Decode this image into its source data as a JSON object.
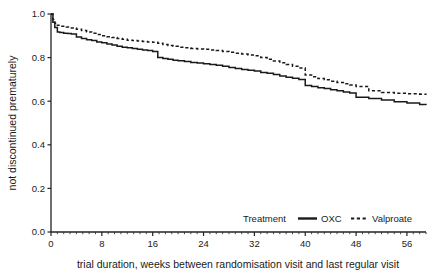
{
  "chart_data": {
    "type": "line",
    "title": "",
    "subtitle": "",
    "xlabel": "trial duration, weeks between randomisation visit and last regular visit",
    "ylabel": "not discontinued prematurely",
    "xlim": [
      0,
      59
    ],
    "ylim": [
      0.0,
      1.0
    ],
    "grid": false,
    "x_ticks": [
      0,
      8,
      16,
      24,
      32,
      40,
      48,
      56
    ],
    "x_tick_labels": [
      "0",
      "8",
      "16",
      "24",
      "32",
      "40",
      "48",
      "56"
    ],
    "y_ticks": [
      0.0,
      0.2,
      0.4,
      0.6,
      0.8,
      1.0
    ],
    "y_tick_labels": [
      "0.0",
      "0.2",
      "0.4",
      "0.6",
      "0.8",
      "1.0"
    ],
    "legend_position": "bottom-right",
    "legend_title": "Treatment",
    "series": [
      {
        "name": "OXC",
        "style": "solid",
        "color": "#1a1a1a",
        "x": [
          0,
          0.3,
          0.6,
          1.0,
          1.4,
          2.0,
          2.6,
          3.2,
          4.0,
          4.8,
          5.6,
          6.4,
          7.2,
          8.0,
          8.8,
          9.6,
          10.4,
          11.2,
          12.0,
          12.8,
          13.6,
          14.4,
          15.2,
          16.0,
          16.8,
          17.6,
          18.4,
          19.2,
          20.0,
          21.0,
          22.0,
          23.0,
          24.0,
          25.0,
          26.0,
          27.0,
          28.0,
          29.0,
          30.0,
          31.0,
          32.0,
          33.0,
          34.0,
          35.0,
          36.0,
          37.0,
          38.0,
          39.0,
          40.0,
          41.0,
          42.0,
          43.0,
          44.0,
          45.0,
          46.0,
          47.0,
          48.0,
          50.0,
          52.0,
          54.0,
          56.0,
          58.0,
          59.0
        ],
        "y": [
          1.0,
          0.962,
          0.938,
          0.918,
          0.915,
          0.912,
          0.91,
          0.908,
          0.895,
          0.888,
          0.882,
          0.878,
          0.872,
          0.868,
          0.862,
          0.858,
          0.852,
          0.848,
          0.845,
          0.842,
          0.838,
          0.835,
          0.832,
          0.828,
          0.8,
          0.796,
          0.792,
          0.788,
          0.785,
          0.782,
          0.778,
          0.775,
          0.772,
          0.768,
          0.765,
          0.76,
          0.755,
          0.75,
          0.745,
          0.742,
          0.738,
          0.732,
          0.728,
          0.722,
          0.716,
          0.71,
          0.705,
          0.7,
          0.672,
          0.668,
          0.662,
          0.658,
          0.652,
          0.648,
          0.642,
          0.638,
          0.618,
          0.612,
          0.605,
          0.598,
          0.592,
          0.585,
          0.582
        ]
      },
      {
        "name": "Valproate",
        "style": "dashed",
        "color": "#1a1a1a",
        "x": [
          0,
          0.3,
          0.6,
          1.0,
          1.6,
          2.4,
          3.2,
          4.0,
          4.8,
          5.6,
          6.4,
          7.2,
          8.0,
          8.8,
          9.6,
          10.4,
          11.2,
          12.0,
          12.8,
          13.6,
          14.4,
          15.2,
          16.0,
          16.8,
          17.6,
          18.4,
          19.2,
          20.0,
          21.0,
          22.0,
          23.0,
          24.0,
          25.0,
          26.0,
          27.0,
          28.0,
          29.0,
          30.0,
          31.0,
          32.0,
          33.0,
          34.0,
          35.0,
          36.0,
          37.0,
          38.0,
          39.0,
          40.0,
          41.0,
          42.0,
          43.0,
          44.0,
          45.0,
          46.0,
          47.0,
          48.0,
          50.0,
          52.0,
          54.0,
          56.0,
          58.0,
          59.0
        ],
        "y": [
          1.0,
          0.975,
          0.958,
          0.948,
          0.944,
          0.94,
          0.936,
          0.93,
          0.924,
          0.918,
          0.912,
          0.906,
          0.9,
          0.896,
          0.892,
          0.888,
          0.884,
          0.88,
          0.878,
          0.876,
          0.874,
          0.872,
          0.87,
          0.866,
          0.86,
          0.856,
          0.852,
          0.848,
          0.845,
          0.842,
          0.84,
          0.838,
          0.835,
          0.832,
          0.828,
          0.824,
          0.82,
          0.816,
          0.812,
          0.808,
          0.8,
          0.792,
          0.784,
          0.776,
          0.768,
          0.76,
          0.752,
          0.72,
          0.712,
          0.704,
          0.698,
          0.692,
          0.686,
          0.68,
          0.674,
          0.668,
          0.648,
          0.64,
          0.636,
          0.634,
          0.632,
          0.63
        ]
      }
    ],
    "annotations": []
  },
  "legend": {
    "title": "Treatment",
    "entry_oxc": "OXC",
    "entry_valproate": "Valproate"
  },
  "axes": {
    "y_title": "not discontinued prematurely",
    "x_title": "trial duration, weeks between randomisation visit and last regular visit"
  }
}
